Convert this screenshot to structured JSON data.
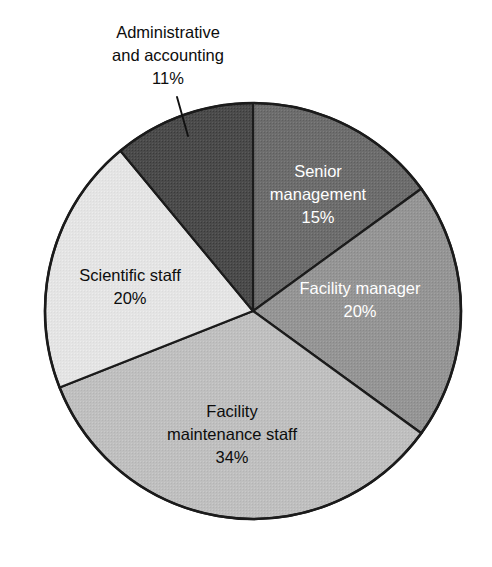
{
  "chart_data": {
    "type": "pie",
    "title": "",
    "subtitle": "",
    "xlabel": "",
    "ylabel": "",
    "legend_position": "none",
    "grid": false,
    "labels_on_slices": true,
    "value_suffix": "%",
    "categories": [
      "Senior management",
      "Facility manager",
      "Facility maintenance staff",
      "Scientific staff",
      "Administrative and accounting"
    ],
    "values": [
      15,
      20,
      34,
      20,
      11
    ],
    "value_labels": [
      "15%",
      "20%",
      "34%",
      "20%",
      "11%"
    ],
    "start_angle_deg": 0,
    "direction": "clockwise",
    "slices": [
      {
        "name": "Senior management",
        "label_lines": [
          "Senior",
          "management"
        ],
        "value": 15,
        "value_label": "15%",
        "color": "#6d6d6d",
        "text_color": "#ffffff",
        "label_placement": "inside",
        "start_deg": 0,
        "sweep_deg": 54
      },
      {
        "name": "Facility manager",
        "label_lines": [
          "Facility manager"
        ],
        "value": 20,
        "value_label": "20%",
        "color": "#959595",
        "text_color": "#ffffff",
        "label_placement": "inside",
        "start_deg": 54,
        "sweep_deg": 72
      },
      {
        "name": "Facility maintenance staff",
        "label_lines": [
          "Facility",
          "maintenance staff"
        ],
        "value": 34,
        "value_label": "34%",
        "color": "#bfbfbf",
        "text_color": "#0d0d0d",
        "label_placement": "inside",
        "start_deg": 126,
        "sweep_deg": 122.4
      },
      {
        "name": "Scientific staff",
        "label_lines": [
          "Scientific staff"
        ],
        "value": 20,
        "value_label": "20%",
        "color": "#e4e4e4",
        "text_color": "#0d0d0d",
        "label_placement": "inside",
        "start_deg": 248.4,
        "sweep_deg": 72
      },
      {
        "name": "Administrative and accounting",
        "label_lines": [
          "Administrative",
          "and accounting"
        ],
        "value": 11,
        "value_label": "11%",
        "color": "#4b4b4b",
        "text_color": "#0d0d0d",
        "label_placement": "outside",
        "start_deg": 320.4,
        "sweep_deg": 39.6
      }
    ],
    "geometry": {
      "center_x": 253,
      "center_y": 311,
      "radius": 208
    }
  },
  "labels": {
    "senior_management": {
      "line1": "Senior",
      "line2": "management",
      "value": "15%"
    },
    "facility_manager": {
      "line1": "Facility manager",
      "value": "20%"
    },
    "facility_maintenance_staff": {
      "line1": "Facility",
      "line2": "maintenance staff",
      "value": "34%"
    },
    "scientific_staff": {
      "line1": "Scientific staff",
      "value": "20%"
    },
    "administrative_accounting": {
      "line1": "Administrative",
      "line2": "and accounting",
      "value": "11%"
    }
  }
}
